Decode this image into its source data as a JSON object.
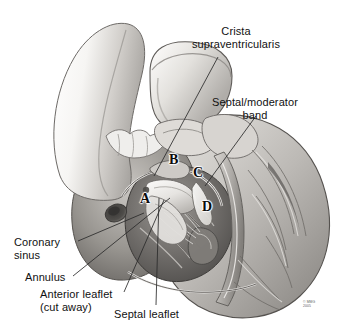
{
  "figure": {
    "background_color": "#ffffff",
    "width": 357,
    "height": 334
  },
  "labels": [
    {
      "id": "crista-supraventricularis",
      "line1": "Crista",
      "line2": "supraventricularis",
      "x": 236,
      "y": 25,
      "align": "center",
      "leader": {
        "x1": 218,
        "y1": 57,
        "x2": 154,
        "y2": 176
      }
    },
    {
      "id": "septal-moderator-band",
      "line1": "Septal/moderator",
      "line2": "band",
      "x": 255,
      "y": 96,
      "align": "center",
      "leader": {
        "x1": 256,
        "y1": 116,
        "x2": 205,
        "y2": 186
      }
    },
    {
      "id": "coronary-sinus",
      "line1": "Coronary",
      "line2": "sinus",
      "x": 14,
      "y": 236,
      "align": "left",
      "leader": {
        "x1": 78,
        "y1": 241,
        "x2": 144,
        "y2": 213
      }
    },
    {
      "id": "annulus",
      "line1": "Annulus",
      "line2": "",
      "x": 25,
      "y": 271,
      "align": "left",
      "leader": {
        "x1": 73,
        "y1": 276,
        "x2": 170,
        "y2": 198
      }
    },
    {
      "id": "anterior-leaflet",
      "line1": "Anterior leaflet",
      "line2": "(cut away)",
      "x": 40,
      "y": 288,
      "align": "left",
      "leader": {
        "x1": 124,
        "y1": 292,
        "x2": 164,
        "y2": 200
      }
    },
    {
      "id": "septal-leaflet",
      "line1": "Septal leaflet",
      "line2": "",
      "x": 114,
      "y": 308,
      "align": "left",
      "leader": {
        "x1": 156,
        "y1": 305,
        "x2": 159,
        "y2": 198
      }
    }
  ],
  "markers": [
    {
      "id": "marker-a",
      "text": "A",
      "x": 140,
      "y": 191
    },
    {
      "id": "marker-b",
      "text": "B",
      "x": 169,
      "y": 152
    },
    {
      "id": "marker-c",
      "text": "C",
      "x": 193,
      "y": 165
    },
    {
      "id": "marker-d",
      "text": "D",
      "x": 202,
      "y": 199
    }
  ],
  "credit": {
    "line1": "© MMG",
    "line2": "2005",
    "x": 303,
    "y": 300
  },
  "palette": {
    "ink": "#111111",
    "leader_line": "#2a2a2a",
    "tissue_light": "#f2f1ef",
    "tissue_mid": "#bdbab6",
    "tissue_dark": "#6f6c69",
    "tissue_darkest": "#3b3937",
    "outline": "#4a4846"
  }
}
